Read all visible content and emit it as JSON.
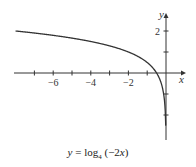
{
  "chart_data": {
    "type": "line",
    "title": "y = log4 (−2x)",
    "function": "y = log_4(-2x)",
    "xlabel": "x",
    "ylabel": "y",
    "xlim": [
      -8,
      0.6
    ],
    "ylim": [
      -3.1,
      2.6
    ],
    "x_ticks": [
      -7,
      -6,
      -5,
      -4,
      -3,
      -2,
      -1
    ],
    "x_tick_labels": [
      {
        "value": -6,
        "label": "−6"
      },
      {
        "value": -4,
        "label": "−4"
      },
      {
        "value": -2,
        "label": "−2"
      }
    ],
    "y_ticks": [
      -2,
      -1,
      1,
      2
    ],
    "y_tick_labels": [
      {
        "value": 2,
        "label": "2"
      }
    ],
    "grid": false,
    "series": [
      {
        "name": "y = log4(-2x)",
        "x": [
          -8,
          -7,
          -6,
          -5,
          -4,
          -3,
          -2,
          -1,
          -0.5,
          -0.25,
          -0.1,
          -0.05,
          -0.02
        ],
        "y": [
          2.0,
          1.9,
          1.79,
          1.66,
          1.5,
          1.29,
          1.0,
          0.5,
          0.0,
          -0.5,
          -1.16,
          -1.66,
          -2.32
        ]
      }
    ],
    "color": "#333333"
  },
  "caption": {
    "prefix": "y",
    "equals": " = log",
    "base": "4",
    "arg_open": " (−2",
    "arg_var": "x",
    "arg_close": ")"
  },
  "axes": {
    "x_label": "x",
    "y_label": "y"
  }
}
